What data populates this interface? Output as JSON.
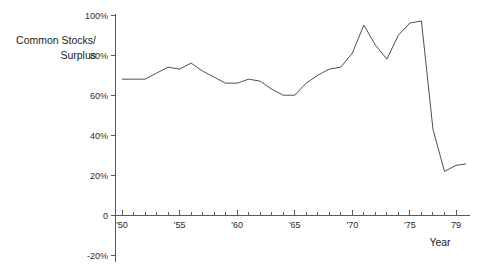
{
  "chart_data": {
    "type": "line",
    "title": "",
    "subtitle": "",
    "xlabel": "Year",
    "ylabel": "Common Stocks/ Surplus",
    "ylabel_lines": [
      "Common Stocks/",
      "Surplus"
    ],
    "grid": false,
    "legend": false,
    "legend_position": "none",
    "xlim": [
      1950,
      1979
    ],
    "ylim": [
      -20,
      100
    ],
    "y_ticks": [
      100,
      80,
      60,
      40,
      20,
      0,
      -20
    ],
    "y_tick_labels": [
      "100%",
      "80%",
      "60%",
      "40%",
      "20%",
      "0",
      "-20%"
    ],
    "x_ticks": [
      1950,
      1955,
      1960,
      1965,
      1970,
      1975,
      1979
    ],
    "x_tick_labels": [
      "'50",
      "'55",
      "'60",
      "'65",
      "'70",
      "'75",
      "79"
    ],
    "x_minor_tick_interval": 1,
    "series": [
      {
        "name": "Common Stocks/Surplus",
        "color": "#4b5155",
        "x": [
          1950,
          1951,
          1952,
          1953,
          1954,
          1955,
          1956,
          1957,
          1958,
          1959,
          1960,
          1961,
          1962,
          1963,
          1964,
          1965,
          1966,
          1967,
          1968,
          1969,
          1970,
          1971,
          1972,
          1973,
          1974,
          1975,
          1976,
          1977,
          1978,
          1979
        ],
        "values": [
          68,
          68,
          68,
          68,
          72,
          74,
          73,
          77,
          73,
          70,
          67,
          66,
          67,
          69,
          66,
          62,
          60,
          60,
          67,
          70,
          73,
          75,
          74,
          81,
          89,
          95,
          79,
          87,
          93,
          97
        ]
      }
    ],
    "plotted_points": [
      {
        "year": 1950,
        "value": 68
      },
      {
        "year": 1951,
        "value": 68
      },
      {
        "year": 1952,
        "value": 68
      },
      {
        "year": 1953,
        "value": 71
      },
      {
        "year": 1954,
        "value": 74
      },
      {
        "year": 1955,
        "value": 73
      },
      {
        "year": 1956,
        "value": 76
      },
      {
        "year": 1957,
        "value": 72
      },
      {
        "year": 1958,
        "value": 69
      },
      {
        "year": 1959,
        "value": 66
      },
      {
        "year": 1960,
        "value": 66
      },
      {
        "year": 1961,
        "value": 68
      },
      {
        "year": 1962,
        "value": 67
      },
      {
        "year": 1963,
        "value": 63
      },
      {
        "year": 1964,
        "value": 60
      },
      {
        "year": 1965,
        "value": 60
      },
      {
        "year": 1966,
        "value": 66
      },
      {
        "year": 1967,
        "value": 70
      },
      {
        "year": 1968,
        "value": 73
      },
      {
        "year": 1969,
        "value": 74
      },
      {
        "year": 1970,
        "value": 81
      },
      {
        "year": 1971,
        "value": 95
      },
      {
        "year": 1972,
        "value": 85
      },
      {
        "year": 1973,
        "value": 78
      },
      {
        "year": 1974,
        "value": 90
      },
      {
        "year": 1975,
        "value": 96
      },
      {
        "year": 1976,
        "value": 97
      },
      {
        "year": 1977,
        "value": 43
      },
      {
        "year": 1978,
        "value": 22
      },
      {
        "year": 1979,
        "value": 25
      }
    ]
  },
  "axes": {
    "y_title_line1": "Common Stocks/",
    "y_title_line2": "Surplus",
    "x_title": "Year"
  }
}
